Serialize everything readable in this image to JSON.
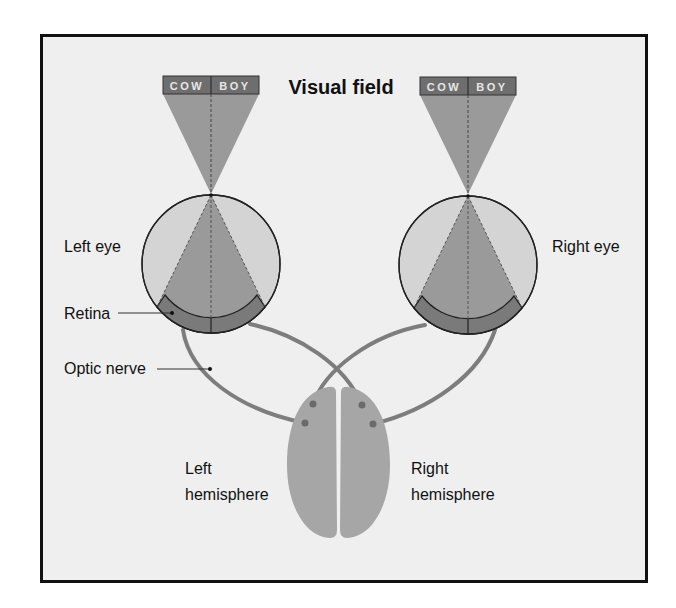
{
  "title": "Visual field",
  "visual_field_word": {
    "left_part": "COW",
    "right_part": "BOY"
  },
  "labels": {
    "left_eye": "Left eye",
    "right_eye": "Right eye",
    "retina": "Retina",
    "optic_nerve": "Optic nerve",
    "left_hemisphere_line1": "Left",
    "left_hemisphere_line2": "hemisphere",
    "right_hemisphere_line1": "Right",
    "right_hemisphere_line2": "hemisphere"
  },
  "colors": {
    "background": "#efefef",
    "frame": "#111111",
    "label_bar": "#6e6e6e",
    "cone": "#9a9a9a",
    "eye_fill": "#d4d4d4",
    "retina": "#7a7a7a",
    "nerve": "#7d7d7d",
    "brain": "#a6a6a6"
  }
}
